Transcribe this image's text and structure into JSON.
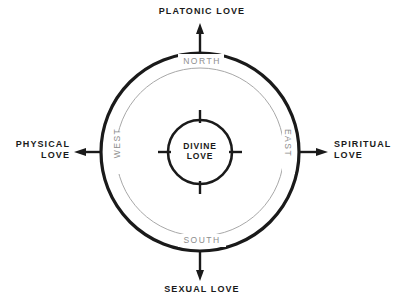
{
  "diagram": {
    "center": {
      "label": "DIVINE\nLOVE",
      "line1": "DIVINE",
      "line2": "LOVE"
    },
    "axes": [
      {
        "id": "north",
        "direction_label": "NORTH",
        "love_label": "PLATONIC LOVE",
        "arrow": "up-arrow"
      },
      {
        "id": "east",
        "direction_label": "EAST",
        "love_label": "SPIRITUAL\nLOVE",
        "love_label_line1": "SPIRITUAL",
        "love_label_line2": "LOVE",
        "arrow": "right-arrow"
      },
      {
        "id": "south",
        "direction_label": "SOUTH",
        "love_label": "SEXUAL LOVE",
        "arrow": "down-arrow"
      },
      {
        "id": "west",
        "direction_label": "WEST",
        "love_label": "PHYSICAL\nLOVE",
        "love_label_line1": "PHYSICAL",
        "love_label_line2": "LOVE",
        "arrow": "left-arrow"
      }
    ],
    "colors": {
      "stroke_dark": "#1a1a1a",
      "stroke_gray": "#a0a0a0",
      "text_dark": "#1a1a1a",
      "text_gray": "#8d8d8d",
      "background": "#ffffff"
    },
    "geometry": {
      "center_x": 200,
      "center_y": 152,
      "outer_radius": 99,
      "middle_radius": 84,
      "inner_radius": 32
    }
  }
}
